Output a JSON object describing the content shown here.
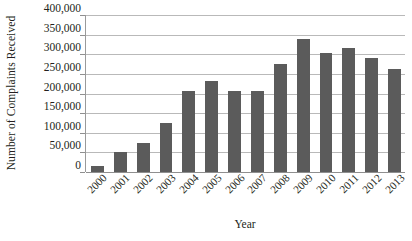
{
  "chart_data": {
    "type": "bar",
    "title": "",
    "xlabel": "Year",
    "ylabel": "Number of Complaints Received",
    "categories": [
      "2000",
      "2001",
      "2002",
      "2003",
      "2004",
      "2005",
      "2006",
      "2007",
      "2008",
      "2009",
      "2010",
      "2011",
      "2012",
      "2013"
    ],
    "values": [
      16000,
      50000,
      75000,
      125000,
      207000,
      232000,
      207000,
      206000,
      276000,
      340000,
      304000,
      315000,
      290000,
      263000
    ],
    "series": [
      {
        "name": "Complaints Received",
        "values": [
          16000,
          50000,
          75000,
          125000,
          207000,
          232000,
          207000,
          206000,
          276000,
          340000,
          304000,
          315000,
          290000,
          263000
        ]
      }
    ],
    "ylim": [
      0,
      400000
    ],
    "ytick_values": [
      0,
      50000,
      100000,
      150000,
      200000,
      250000,
      300000,
      350000,
      400000
    ],
    "ytick_labels": [
      "0",
      "50,000",
      "100,000",
      "150,000",
      "200,000",
      "250,000",
      "300,000",
      "350,000",
      "400,000"
    ],
    "grid": true,
    "grid_axis": "y",
    "legend": false,
    "legend_position": "none",
    "bar_color": "#5b5b5b",
    "gridline_color": "#b9b9b9",
    "axis_color": "#8f8f8f",
    "background_color": "#ffffff",
    "xtick_rotation": -45
  }
}
